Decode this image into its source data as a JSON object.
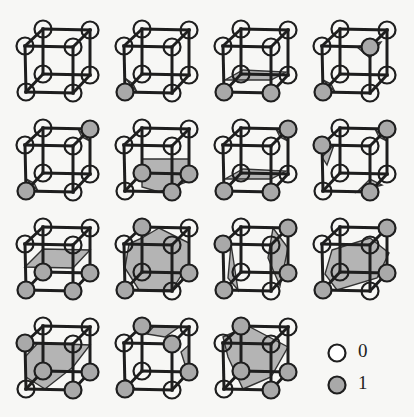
{
  "figure": {
    "grid": {
      "columns": 4,
      "rows": 4,
      "cell_spacing": 99
    },
    "colors": {
      "background": "#f7f7f5",
      "edge": "#1e1e1e",
      "vertex_zero_fill": "#ffffff",
      "vertex_one_fill": "#a9a9a9",
      "surface_fill": "#b4b4b4"
    },
    "vertex_positions": {
      "btl": [
        43,
        29
      ],
      "btr": [
        90,
        30
      ],
      "ftl": [
        25,
        46
      ],
      "ftr": [
        73,
        47
      ],
      "bbl": [
        43,
        74
      ],
      "bbr": [
        90,
        75
      ],
      "fbl": [
        26,
        92
      ],
      "fbr": [
        73,
        93
      ]
    },
    "cases": [
      {
        "id": 0,
        "row": 0,
        "col": 0,
        "active": [],
        "surfaces": []
      },
      {
        "id": 1,
        "row": 0,
        "col": 1,
        "active": [
          "fbl"
        ],
        "surfaces": [
          [
            [
              26,
              78
            ],
            [
              38,
              92
            ],
            [
              34,
              84
            ]
          ]
        ]
      },
      {
        "id": 2,
        "row": 0,
        "col": 2,
        "active": [
          "fbl",
          "fbr"
        ],
        "surfaces": [
          [
            [
              27,
              80
            ],
            [
              73,
              80
            ],
            [
              88,
              72
            ],
            [
              45,
              70
            ]
          ]
        ]
      },
      {
        "id": 3,
        "row": 0,
        "col": 3,
        "active": [
          "fbl",
          "ftr"
        ],
        "surfaces": [
          [
            [
              60,
              47
            ],
            [
              73,
              58
            ],
            [
              84,
              42
            ]
          ],
          [
            [
              26,
              80
            ],
            [
              38,
              92
            ],
            [
              34,
              84
            ]
          ]
        ]
      },
      {
        "id": 4,
        "row": 1,
        "col": 0,
        "active": [
          "btr",
          "fbl"
        ],
        "surfaces": [
          [
            [
              78,
              30
            ],
            [
              90,
              42
            ],
            [
              82,
              38
            ]
          ],
          [
            [
              26,
              80
            ],
            [
              38,
              92
            ],
            [
              34,
              84
            ]
          ]
        ]
      },
      {
        "id": 5,
        "row": 1,
        "col": 1,
        "active": [
          "bbl",
          "bbr",
          "fbr"
        ],
        "surfaces": [
          [
            [
              43,
              60
            ],
            [
              90,
              60
            ],
            [
              90,
              82
            ],
            [
              60,
              93
            ],
            [
              43,
              88
            ]
          ]
        ]
      },
      {
        "id": 6,
        "row": 1,
        "col": 2,
        "active": [
          "btr",
          "fbl",
          "fbr"
        ],
        "surfaces": [
          [
            [
              27,
              80
            ],
            [
              73,
              80
            ],
            [
              88,
              72
            ],
            [
              45,
              70
            ]
          ],
          [
            [
              78,
              30
            ],
            [
              90,
              42
            ],
            [
              82,
              38
            ]
          ]
        ]
      },
      {
        "id": 7,
        "row": 1,
        "col": 3,
        "active": [
          "btr",
          "ftl",
          "fbr"
        ],
        "surfaces": [
          [
            [
              25,
              58
            ],
            [
              37,
              46
            ],
            [
              30,
              66
            ]
          ],
          [
            [
              78,
              30
            ],
            [
              90,
              42
            ],
            [
              82,
              38
            ]
          ],
          [
            [
              60,
              93
            ],
            [
              73,
              80
            ],
            [
              85,
              86
            ]
          ]
        ]
      },
      {
        "id": 8,
        "row": 2,
        "col": 0,
        "active": [
          "bbl",
          "bbr",
          "fbl",
          "fbr"
        ],
        "surfaces": [
          [
            [
              25,
              69
            ],
            [
              43,
              51
            ],
            [
              90,
              52
            ],
            [
              73,
              70
            ]
          ]
        ]
      },
      {
        "id": 9,
        "row": 2,
        "col": 1,
        "active": [
          "btl",
          "fbl",
          "bbr"
        ],
        "surfaces": [
          [
            [
              30,
              46
            ],
            [
              43,
              40
            ],
            [
              60,
              30
            ],
            [
              90,
              45
            ],
            [
              90,
              65
            ],
            [
              73,
              92
            ],
            [
              40,
              92
            ],
            [
              26,
              70
            ]
          ]
        ]
      },
      {
        "id": 10,
        "row": 2,
        "col": 2,
        "active": [
          "btr",
          "ftl",
          "fbl",
          "bbr"
        ],
        "surfaces": [
          [
            [
              33,
              46
            ],
            [
              40,
              92
            ],
            [
              30,
              80
            ]
          ],
          [
            [
              75,
              30
            ],
            [
              90,
              50
            ],
            [
              82,
              88
            ],
            [
              70,
              60
            ]
          ]
        ]
      },
      {
        "id": 11,
        "row": 2,
        "col": 3,
        "active": [
          "btr",
          "fbl",
          "bbr"
        ],
        "surfaces": [
          [
            [
              35,
              52
            ],
            [
              73,
              40
            ],
            [
              92,
              55
            ],
            [
              80,
              80
            ],
            [
              40,
              92
            ],
            [
              28,
              76
            ]
          ]
        ]
      },
      {
        "id": 12,
        "row": 3,
        "col": 0,
        "active": [
          "ftl",
          "bbl",
          "bbr",
          "fbr"
        ],
        "surfaces": [
          [
            [
              25,
              60
            ],
            [
              38,
              46
            ],
            [
              90,
              48
            ],
            [
              73,
              70
            ],
            [
              45,
              92
            ],
            [
              26,
              80
            ]
          ]
        ]
      },
      {
        "id": 13,
        "row": 3,
        "col": 1,
        "active": [
          "btl",
          "ftr",
          "bbr",
          "fbl"
        ],
        "surfaces": [
          [
            [
              55,
              29
            ],
            [
              80,
              30
            ],
            [
              66,
              40
            ],
            [
              48,
              37
            ]
          ],
          [
            [
              82,
              55
            ],
            [
              90,
              48
            ],
            [
              90,
              80
            ]
          ],
          [
            [
              26,
              82
            ],
            [
              36,
              92
            ],
            [
              30,
              84
            ]
          ]
        ]
      },
      {
        "id": 14,
        "row": 3,
        "col": 2,
        "active": [
          "btl",
          "bbl",
          "bbr",
          "fbr"
        ],
        "surfaces": [
          [
            [
              25,
              40
            ],
            [
              50,
              29
            ],
            [
              90,
              50
            ],
            [
              73,
              80
            ],
            [
              45,
              92
            ],
            [
              30,
              60
            ]
          ]
        ]
      }
    ],
    "legend": {
      "items": [
        {
          "symbol": "vertex-zero",
          "label": "0"
        },
        {
          "symbol": "vertex-one",
          "label": "1"
        }
      ]
    }
  }
}
